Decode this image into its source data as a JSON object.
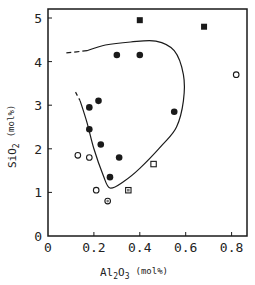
{
  "chart_data": {
    "type": "scatter",
    "title": "",
    "xlabel": "Al2O3 (mol%)",
    "ylabel": "SiO2 (mol%)",
    "xlim": [
      0,
      0.87
    ],
    "ylim": [
      0,
      5.2
    ],
    "xticks": [
      0,
      0.2,
      0.4,
      0.6,
      0.8
    ],
    "xtick_labels": [
      "0",
      "0.2",
      "0.4",
      "0.6",
      "0.8"
    ],
    "yticks": [
      0,
      1,
      2,
      3,
      4,
      5
    ],
    "ytick_labels": [
      "0",
      "1",
      "2",
      "3",
      "4",
      "5"
    ],
    "grid": false,
    "legend": null,
    "series": [
      {
        "name": "filled-square",
        "marker": "square-filled",
        "points": [
          [
            0.4,
            4.95
          ],
          [
            0.68,
            4.8
          ]
        ]
      },
      {
        "name": "filled-circle",
        "marker": "circle-filled",
        "points": [
          [
            0.3,
            4.15
          ],
          [
            0.4,
            4.15
          ],
          [
            0.18,
            2.95
          ],
          [
            0.22,
            3.1
          ],
          [
            0.18,
            2.45
          ],
          [
            0.23,
            2.1
          ],
          [
            0.31,
            1.8
          ],
          [
            0.55,
            2.85
          ],
          [
            0.27,
            1.35
          ]
        ]
      },
      {
        "name": "open-circle",
        "marker": "circle-open",
        "points": [
          [
            0.82,
            3.7
          ],
          [
            0.13,
            1.85
          ],
          [
            0.18,
            1.8
          ],
          [
            0.21,
            1.05
          ]
        ]
      },
      {
        "name": "dotted-circle",
        "marker": "circle-dotted",
        "points": [
          [
            0.26,
            0.8
          ]
        ]
      },
      {
        "name": "open-square",
        "marker": "square-open",
        "points": [
          [
            0.46,
            1.65
          ]
        ]
      },
      {
        "name": "dotted-square",
        "marker": "square-dotted",
        "points": [
          [
            0.35,
            1.05
          ]
        ]
      }
    ],
    "boundary_curve": {
      "description": "closed-ish boundary region, dashed at upper-left ends",
      "solid": [
        [
          0.17,
          4.25
        ],
        [
          0.25,
          4.38
        ],
        [
          0.36,
          4.45
        ],
        [
          0.47,
          4.47
        ],
        [
          0.55,
          4.25
        ],
        [
          0.59,
          3.7
        ],
        [
          0.59,
          3.1
        ],
        [
          0.56,
          2.5
        ],
        [
          0.5,
          2.1
        ],
        [
          0.4,
          1.55
        ],
        [
          0.33,
          1.25
        ],
        [
          0.27,
          1.1
        ],
        [
          0.24,
          1.4
        ],
        [
          0.2,
          2.0
        ],
        [
          0.17,
          2.6
        ],
        [
          0.14,
          3.1
        ]
      ],
      "dashed_top": [
        [
          0.08,
          4.2
        ],
        [
          0.17,
          4.25
        ]
      ],
      "dashed_left": [
        [
          0.12,
          3.3
        ],
        [
          0.14,
          3.1
        ]
      ]
    }
  },
  "axes": {
    "x_title_main": "Al",
    "x_title_sub1": "2",
    "x_title_mid": "O",
    "x_title_sub2": "3",
    "x_title_unit": "(mol%)",
    "y_title_main": "SiO",
    "y_title_sub": "2",
    "y_title_unit": "(mol%)"
  },
  "colors": {
    "ink": "#1a1a1a",
    "background": "#ffffff"
  }
}
